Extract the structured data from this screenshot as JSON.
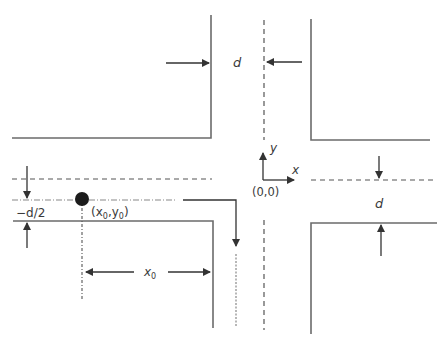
{
  "diagram": {
    "type": "intersection-geometry",
    "colors": {
      "line": "#6b6b6b",
      "arrow": "#333333",
      "ball": "#1c1c1c",
      "text": "#3a3a3a"
    },
    "labels": {
      "d_top": "d",
      "d_right": "d",
      "minus_d_half": "−d/2",
      "ball_position": "(x",
      "ball_x_sub": "0",
      "ball_sep": ",y",
      "ball_y_sub": "0",
      "ball_close": ")",
      "origin": "(0,0)",
      "axis_x": "x",
      "axis_y": "y",
      "x0_main": "x",
      "x0_sub": "0"
    }
  }
}
